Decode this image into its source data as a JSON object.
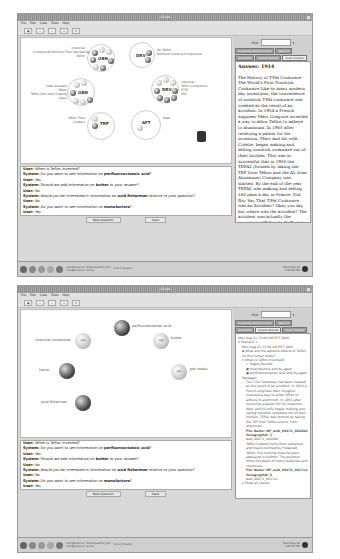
{
  "top_screenshot": {
    "window_title": "CSI-QA",
    "menu": [
      "File",
      "Edit",
      "View",
      "Tools",
      "Help"
    ],
    "toolbar": [
      "back",
      "info",
      "zoom-out",
      "zoom-in",
      "refresh"
    ],
    "find_label": "Find:",
    "tabs": [
      "Contextualized Concept",
      "Aspects",
      "Qualifiers",
      "Digest Results",
      "Clear Answer",
      "Related Work",
      "Document History",
      "Network Context"
    ],
    "answer_heading": "Answer: 1914",
    "answer_text": "The History of T-Fal Cookware - The World's First Nonstick Cookware Like so many modern day inventions, the convenience of nonstick T-Fal cookware was created as the result of an accident. In 1954 a French engineer Marc Gregoire invented a way to allow Teflon to adhere to aluminum. In 1955 after receiving a patent for his invention, Marc and his wife, Colette, began making and selling nonstick cookware out of their kitchen. This was so successful that in 1956 the TEFAL (formed by taking the TEF from Teflon and the AL from Aluminum) Company was started. By the end of the year TEFAL was making and selling 100 pans a day in France. Did Roy Say That T-Fal Cookware was an Accident? Okay you say, but where was the accident? The accident was actually the invention of Teflon by DuPont in 1938. It was the result of researching better refrigerants used in refrigeration. It was actually a combination of a refrigerant under pressure at a low temperature that caused a polymer to form. Testing showed the polymer to be highly resistant to chemicals, temperature, electricity, mold, and fungus. Oh yeah,",
    "clusters": [
      {
        "title": "OBN",
        "labels": [
          "chemical",
          "Compounds Without Their Derivatives",
          "Teflon"
        ]
      },
      {
        "title": "DRV",
        "labels": [
          "On Teflon",
          "Nonstick Cooking Compounds"
        ]
      },
      {
        "title": "OBN",
        "labels": [
          "heat resistant",
          "Teflon",
          "Teflon Non-stick Coating",
          "glass"
        ]
      },
      {
        "title": "DRV",
        "labels": [
          "chemical",
          "Teflon Compound",
          "PTFE",
          "PFA"
        ]
      },
      {
        "title": "TRP",
        "labels": [
          "Teflon Time",
          "Cookers"
        ]
      },
      {
        "title": "AFT",
        "labels": [
          "Date"
        ]
      }
    ],
    "dialogue": [
      {
        "speaker": "User:",
        "text": "When is Teflon invented?"
      },
      {
        "speaker": "System:",
        "text": "Do you want to see information on ",
        "bold": "perfluorooctanoic acid",
        "after": "?"
      },
      {
        "speaker": "User:",
        "text": "Yes"
      },
      {
        "speaker": "System:",
        "text": "Should we add information on ",
        "bold": "butter",
        "after": " to your answer?"
      },
      {
        "speaker": "User:",
        "text": "No"
      },
      {
        "speaker": "System:",
        "text": "Would you be interested in information on ",
        "bold": "avid fisherman",
        "after": " relative to your question?"
      },
      {
        "speaker": "User:",
        "text": "No"
      },
      {
        "speaker": "System:",
        "text": "Do you want to see information on ",
        "bold": "manufacture",
        "after": "?"
      },
      {
        "speaker": "User:",
        "text": "Yes"
      },
      {
        "speaker": "System:",
        "text": "Dialogue Completed",
        "bold": "",
        "after": ""
      }
    ],
    "dialog_buttons": [
      "New Question",
      "Save"
    ],
    "taskbar": {
      "tasks": [
        "root@bequest: /download/CSI_GUI",
        "root@bequest: /aerial",
        "Screen Reader"
      ],
      "clock_line1": "Mon Aug 21",
      "clock_line2": "7:20:32 PM"
    }
  },
  "bottom_screenshot": {
    "window_title": "CSI-QA",
    "menu": [
      "File",
      "Edit",
      "View",
      "Tools",
      "Help"
    ],
    "find_label": "Find:",
    "tabs": [
      "Contextualized Concept",
      "Aspects",
      "Qualifiers",
      "Digest Results",
      "Clear Answer",
      "Related Work",
      "Document History",
      "Network Context"
    ],
    "nodes": [
      {
        "label": "perfluorooctanoic acid",
        "dark": true
      },
      {
        "label": "chemical compound",
        "dark": false,
        "inner": "AKA"
      },
      {
        "label": "butter",
        "dark": false,
        "inner": "AKA"
      },
      {
        "label": "home",
        "dark": true
      },
      {
        "label": "pot roasts",
        "dark": false,
        "inner": "AKA"
      },
      {
        "label": "avid fisherman",
        "dark": true
      }
    ],
    "tree": {
      "header": "Mon Aug 21 13:00 AM EST 2006",
      "scenario": "Scenario 1",
      "scenario_time": "Mon Aug 21 13:00 AM EST 2006",
      "q1": "What are the adverse effects of Teflon on the human body?",
      "q2": "When is Teflon invented?",
      "items": [
        "Digest Results",
        "manufacture and by aged",
        "perfluorooctanoic acid and by aged"
      ],
      "passages_label": "Passages",
      "passage1": "The T-Fal Cookware has been created as the result of an accident. In 1954 a French engineer Marc Gregoire invented a way to allow Teflon to adhere to aluminum. In 1955 after receiving a patent for his invention, Marc and his wife began making and selling nonstick cookware out of their kitchen. TEFAL was formed by taking the TEF from Teflon and AL from Aluminum.",
      "file1": "File Name: NF_web_09271_0622b0",
      "para1": "Paragraph#: 1",
      "ref1": "web_09271_0622b0",
      "passage2": "Teflon Subject Items from remained and treats outlined by Flowered Teflon, the cooking material pans appeared in DuPont. The polymer forms the basis of many materials and chemicals.",
      "file2": "File Name: NF_web_09271_0617e1",
      "para2": "Paragraph#: 2",
      "ref2": "web_09271_0617e1",
      "more": "Show all results"
    },
    "dialogue": [
      {
        "speaker": "User:",
        "text": "When is Teflon invented?"
      },
      {
        "speaker": "System:",
        "text": "Do you want to see information on ",
        "bold": "perfluorooctanoic acid",
        "after": "?"
      },
      {
        "speaker": "User:",
        "text": "Yes"
      },
      {
        "speaker": "System:",
        "text": "Should we add information on ",
        "bold": "butter",
        "after": " to your answer?"
      },
      {
        "speaker": "User:",
        "text": "No"
      },
      {
        "speaker": "System:",
        "text": "Would you be interested in information on ",
        "bold": "avid fisherman",
        "after": " relative to your question?"
      },
      {
        "speaker": "User:",
        "text": "No"
      },
      {
        "speaker": "System:",
        "text": "Do you want to see information on ",
        "bold": "manufacture",
        "after": "?"
      },
      {
        "speaker": "User:",
        "text": "Yes"
      },
      {
        "speaker": "System:",
        "text": "Dialogue Completed",
        "bold": "",
        "after": ""
      }
    ],
    "dialog_buttons": [
      "New Question",
      "Save"
    ],
    "taskbar": {
      "tasks": [
        "root@bequest: /download/CSI_GUI",
        "root@bequest: /aerial",
        "Screen Reader"
      ],
      "clock_line1": "Mon Aug 21",
      "clock_line2": "7:24:54 PM"
    }
  }
}
